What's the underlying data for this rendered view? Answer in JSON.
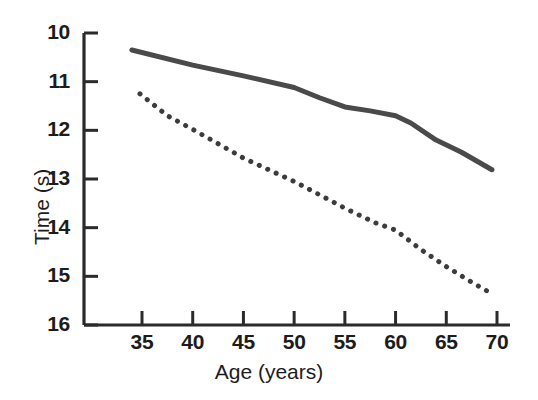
{
  "chart_data": {
    "type": "line",
    "title": "",
    "xlabel": "Age (years)",
    "ylabel": "Time (s)",
    "xlim": [
      32.5,
      71
    ],
    "ylim": [
      16,
      10
    ],
    "y_axis_inverted": true,
    "grid": false,
    "legend": "none",
    "xticks": [
      35,
      40,
      45,
      50,
      55,
      60,
      65,
      70
    ],
    "xtick_labels": [
      "35",
      "40",
      "45",
      "50",
      "55",
      "60",
      "65",
      "70"
    ],
    "yticks": [
      10,
      11,
      12,
      13,
      14,
      15,
      16
    ],
    "ytick_labels": [
      "10",
      "11",
      "12",
      "13",
      "14",
      "15",
      "16"
    ],
    "series": [
      {
        "name": "solid-line",
        "style": "solid",
        "color": "#4a4a4a",
        "linewidth": 5,
        "x": [
          34.0,
          40.0,
          45.0,
          50.0,
          52.5,
          55.0,
          57.5,
          60.0,
          61.5,
          64.0,
          66.5,
          69.5
        ],
        "y": [
          10.35,
          10.66,
          10.88,
          11.12,
          11.33,
          11.52,
          11.6,
          11.7,
          11.85,
          12.2,
          12.45,
          12.81
        ]
      },
      {
        "name": "dotted-line",
        "style": "dotted",
        "color": "#3c3c3c",
        "linewidth": 5,
        "x": [
          34.8,
          37.5,
          40.0,
          45.0,
          50.0,
          55.0,
          58.0,
          60.0,
          62.5,
          65.0,
          67.5,
          69.5
        ],
        "y": [
          11.25,
          11.7,
          11.98,
          12.57,
          13.05,
          13.6,
          13.9,
          14.05,
          14.45,
          14.8,
          15.12,
          15.36
        ]
      }
    ]
  },
  "axes": {
    "x_axis_title": "Age (years)",
    "y_axis_title": "Time (s)"
  }
}
